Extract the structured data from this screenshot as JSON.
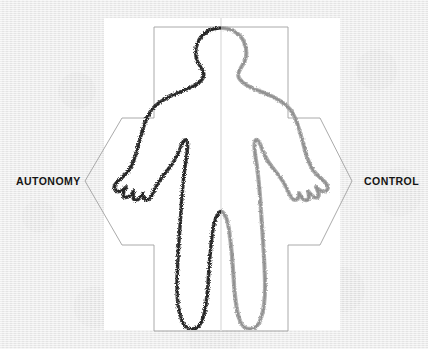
{
  "figure": {
    "background_color": "#ebebeb",
    "panel_color": "#ffffff"
  },
  "labels": {
    "left": "AUTONOMY",
    "right": "CONTROL"
  },
  "arrow": {
    "name": "double-headed-horizontal-arrow",
    "stroke_color": "#9a9a9a",
    "fill": "none",
    "left_tip_label": "AUTONOMY",
    "right_tip_label": "CONTROL"
  },
  "silhouette": {
    "name": "human-figure-outline",
    "left_half_color": "#3b3b3b",
    "right_half_color": "#9e9e9e",
    "centerline_color": "#e3e3e3",
    "description": "Front-facing standing human body outline drawn in rough charcoal stroke, split down the vertical midline"
  }
}
